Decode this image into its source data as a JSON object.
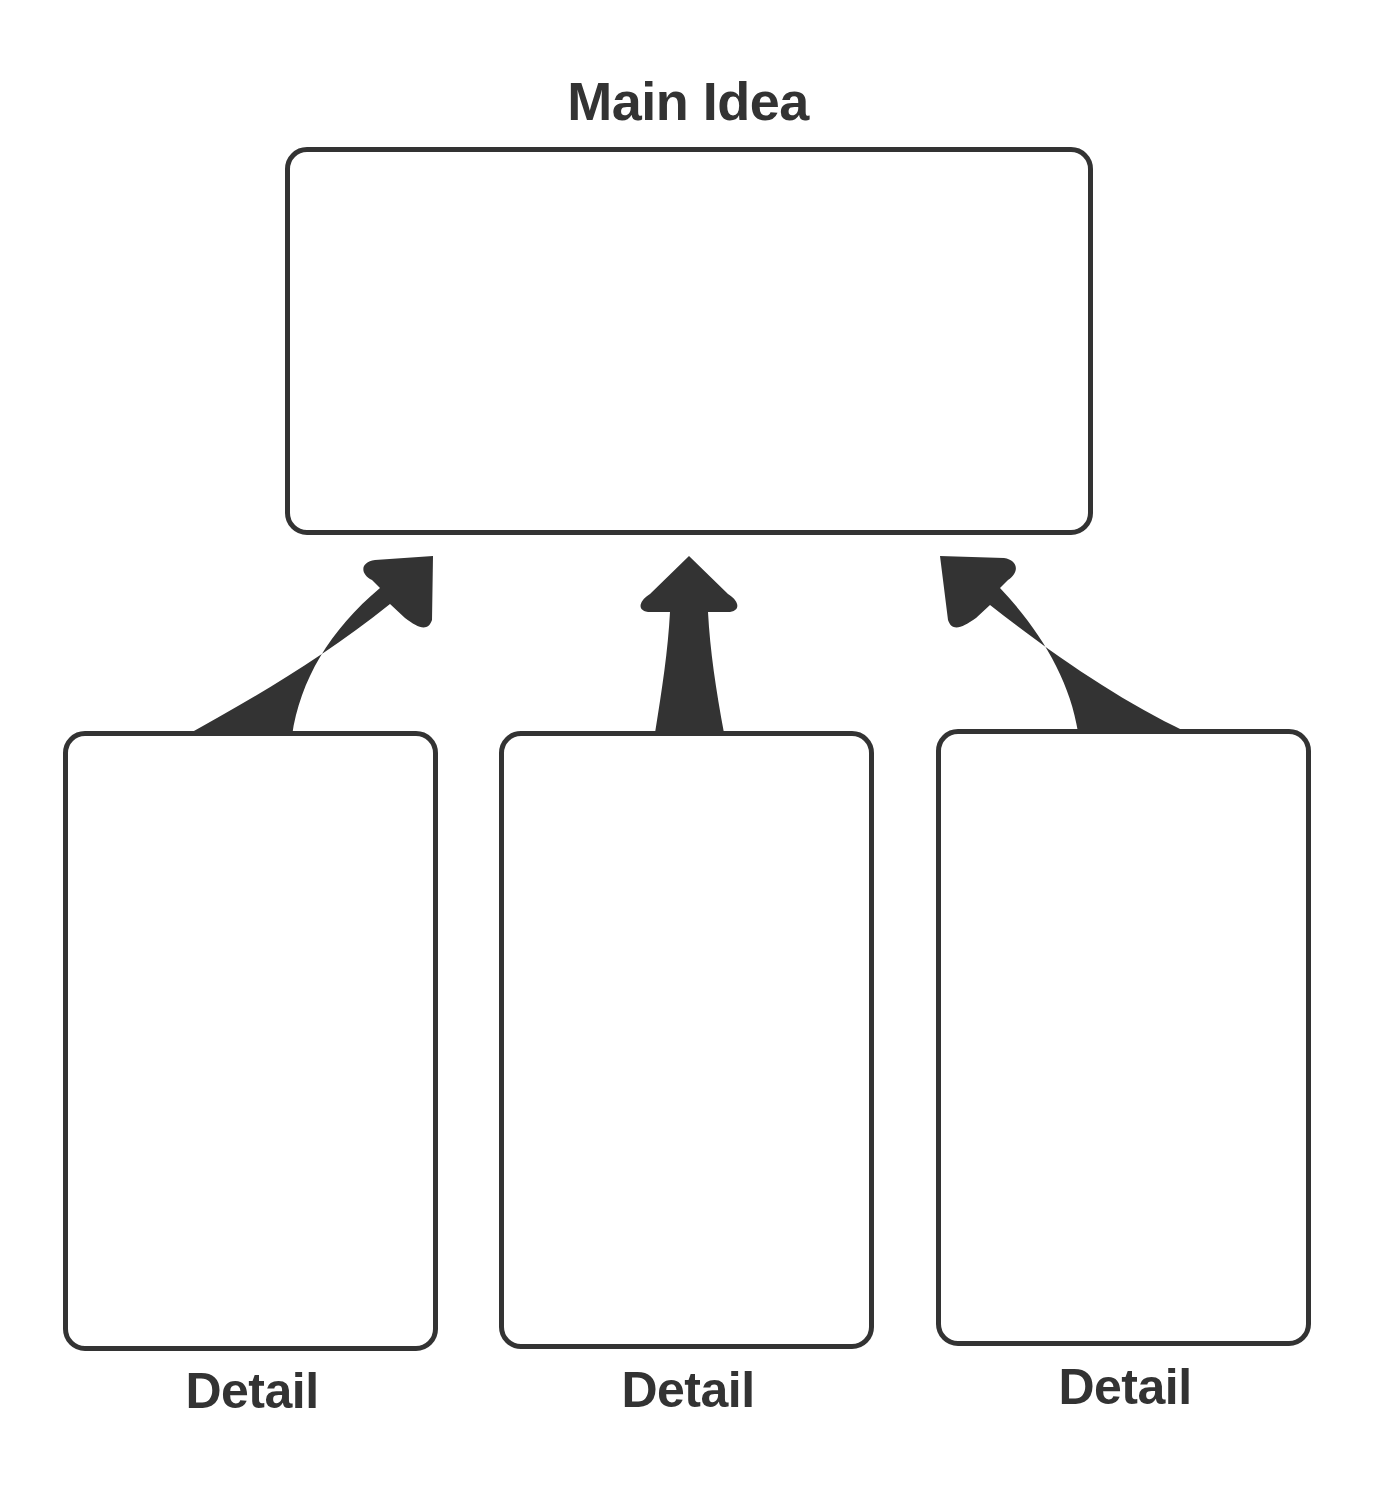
{
  "diagram": {
    "title": "Main Idea",
    "main_box": {
      "label": "Main Idea",
      "content": ""
    },
    "detail_boxes": [
      {
        "label": "Detail",
        "content": ""
      },
      {
        "label": "Detail",
        "content": ""
      },
      {
        "label": "Detail",
        "content": ""
      }
    ],
    "arrows": [
      {
        "from": "detail-1",
        "to": "main-idea"
      },
      {
        "from": "detail-2",
        "to": "main-idea"
      },
      {
        "from": "detail-3",
        "to": "main-idea"
      }
    ],
    "colors": {
      "stroke": "#333333",
      "background": "#ffffff"
    }
  }
}
